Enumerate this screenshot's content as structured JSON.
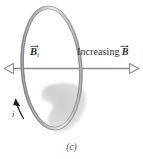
{
  "figure": {
    "caption": "(c)",
    "type": "physics-diagram-induced-current-loop",
    "background_color": "#ffffff",
    "labels": {
      "field_initial": {
        "symbol": "B",
        "subscript": "i",
        "has_vector_arrow": true,
        "full_text": "B i"
      },
      "field_increasing": {
        "text": "Increasing",
        "symbol": "B",
        "has_vector_arrow": true,
        "full_text": "Increasing B"
      },
      "current": {
        "symbol": "i",
        "full_text": "i"
      }
    },
    "elements": {
      "loop": {
        "name": "conducting-loop",
        "shape": "ellipse",
        "center_x": 51.5,
        "center_y": 68,
        "radius_x": 29.5,
        "radius_y": 61,
        "rotation_deg": -4,
        "stroke_color": "#9a9a9a",
        "highlight_color": "#d8d8d8",
        "shadow_color": "#6e6e6e",
        "stroke_width": 3.2
      },
      "field_axis_arrow": {
        "name": "double-headed-field-arrow",
        "x1": 4,
        "x2": 137,
        "y": 68,
        "line_color": "#8c8c8c",
        "arrowhead_style": "hollow-outline",
        "heads": [
          "left",
          "right"
        ]
      },
      "current_arrow": {
        "name": "induced-current-arrow",
        "style": "solid-filled",
        "color": "#2b2b2b",
        "direction": "up-left"
      },
      "shadow_blob": {
        "name": "ground-shadow",
        "color": "#d4d4d4"
      }
    },
    "colors": {
      "text": "#2b2b2b",
      "caption": "#4a4a4a",
      "loop_gray": "#9a9a9a",
      "axis_gray": "#8c8c8c",
      "shadow_gray": "#d4d4d4"
    }
  }
}
